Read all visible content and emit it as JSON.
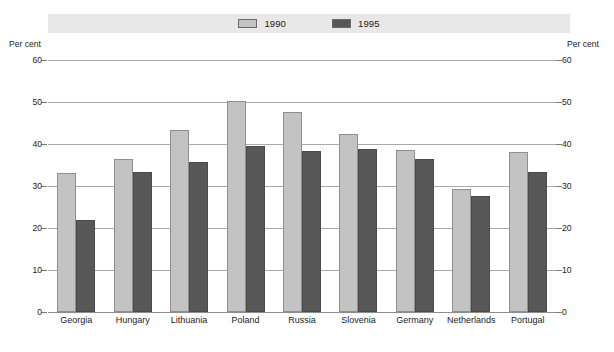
{
  "legend": {
    "entries": [
      {
        "label": "1990",
        "color": "#c3c3c3",
        "swatch": "legend-swatch-1990"
      },
      {
        "label": "1995",
        "color": "#585858",
        "swatch": "legend-swatch-1995"
      }
    ],
    "band_color": "#e8e8e8"
  },
  "axis": {
    "left_caption": "Per cent",
    "right_caption": "Per cent",
    "ticks": [
      "60",
      "50",
      "40",
      "30",
      "20",
      "10",
      "0"
    ]
  },
  "chart_data": {
    "type": "bar",
    "title": "",
    "subtitle": "",
    "xlabel": "",
    "ylabel": "Per cent",
    "ylim": [
      0,
      60
    ],
    "yticks": [
      0,
      10,
      20,
      30,
      40,
      50,
      60
    ],
    "grid": true,
    "legend_position": "top-center",
    "dual_y_axis": true,
    "categories": [
      "Georgia",
      "Hungary",
      "Lithuania",
      "Poland",
      "Russia",
      "Slovenia",
      "Germany",
      "Netherlands",
      "Portugal"
    ],
    "series": [
      {
        "name": "1990",
        "color": "#c3c3c3",
        "values": [
          33.2,
          36.4,
          43.4,
          50.2,
          47.6,
          42.3,
          38.6,
          29.2,
          38.2
        ]
      },
      {
        "name": "1995",
        "color": "#585858",
        "values": [
          21.9,
          33.3,
          35.8,
          39.5,
          38.3,
          38.8,
          36.4,
          27.6,
          33.4
        ]
      }
    ]
  }
}
